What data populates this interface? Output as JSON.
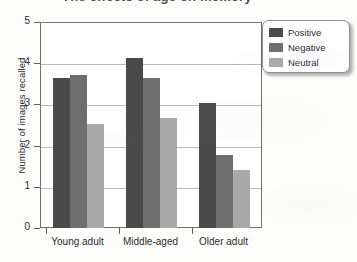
{
  "chart_data": {
    "type": "bar",
    "title": "",
    "xlabel": "",
    "ylabel": "Number of images recalled",
    "ylim": [
      0,
      5
    ],
    "yticks": [
      "0",
      "1",
      "2",
      "3",
      "4",
      "5"
    ],
    "grid": true,
    "legend_position": "top-right",
    "categories": [
      "Young adult",
      "Middle-aged",
      "Older adult"
    ],
    "series": [
      {
        "name": "Positive",
        "color": "#4a4a4a",
        "values": [
          3.67,
          4.15,
          3.05
        ]
      },
      {
        "name": "Negative",
        "color": "#6e6e6e",
        "values": [
          3.72,
          3.65,
          1.77
        ]
      },
      {
        "name": "Neutral",
        "color": "#a9a9a9",
        "values": [
          2.53,
          2.68,
          1.42
        ]
      }
    ]
  },
  "legend": {
    "items": [
      {
        "label": "Positive",
        "color": "#4a4a4a"
      },
      {
        "label": "Negative",
        "color": "#6e6e6e"
      },
      {
        "label": "Neutral",
        "color": "#a9a9a9"
      }
    ]
  },
  "title_remnant": "The effects of age on memory"
}
